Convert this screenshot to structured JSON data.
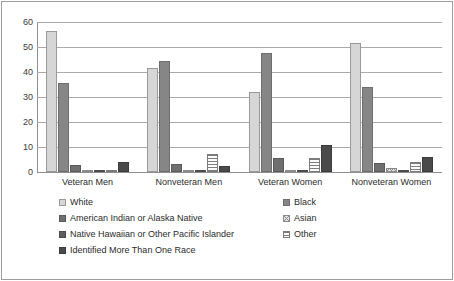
{
  "chart_data": {
    "type": "bar",
    "title": "",
    "xlabel": "",
    "ylabel": "",
    "ylim": [
      0,
      60
    ],
    "yticks": [
      60,
      50,
      40,
      30,
      20,
      10,
      0
    ],
    "grid": true,
    "legend_position": "bottom",
    "categories": [
      "Veteran Men",
      "Nonveteran Men",
      "Veteran Women",
      "Nonveteran Women"
    ],
    "series": [
      {
        "name": "White",
        "color": "#d6d6d6",
        "values": [
          56.5,
          41.8,
          32.0,
          51.6
        ]
      },
      {
        "name": "Black",
        "color": "#868686",
        "values": [
          35.6,
          44.4,
          47.6,
          34.1
        ]
      },
      {
        "name": "American Indian or Alaska Native",
        "color": "#6f6f6f",
        "values": [
          2.8,
          3.4,
          5.5,
          3.8
        ]
      },
      {
        "name": "Asian",
        "color": "#e2e2e2",
        "values": [
          0.3,
          1.0,
          0.2,
          1.5
        ]
      },
      {
        "name": "Native Hawaiian or Other Pacific Islander",
        "color": "#5d5d5d",
        "values": [
          0.7,
          0.6,
          0.1,
          0.6
        ]
      },
      {
        "name": "Other",
        "color": "#fbfbfb",
        "values": [
          0.5,
          7.1,
          5.6,
          4.1
        ]
      },
      {
        "name": "Identified More Than One Race",
        "color": "#4a4a4a",
        "values": [
          4.2,
          2.6,
          10.9,
          6.0
        ]
      }
    ]
  },
  "axis": {
    "y_tick_labels": [
      "60",
      "50",
      "40",
      "30",
      "20",
      "10",
      "0"
    ]
  },
  "legend": {
    "rows": [
      {
        "left": "White",
        "right": "Black"
      },
      {
        "left": "American Indian or Alaska Native",
        "right": "Asian"
      },
      {
        "left": "Native Hawaiian or Other Pacific Islander",
        "right": "Other"
      },
      {
        "left": "Identified More Than One Race",
        "right": ""
      }
    ]
  },
  "colors": {
    "gridline": "#a9a9a9",
    "axis": "#8f8f8f",
    "text": "#2b2b2b",
    "frame": "#9d9d9d"
  }
}
